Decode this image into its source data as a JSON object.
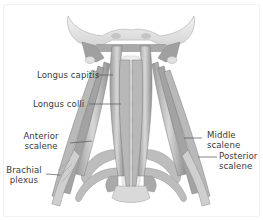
{
  "figure": {
    "style": "grayscale anatomical illustration",
    "colors": {
      "background": "#ffffff",
      "bone": "#e6e6e6",
      "bone_outline": "#b8b8b8",
      "muscle_dark": "#8c8c8c",
      "muscle_mid": "#a8a8a8",
      "muscle_light": "#cfcfcf",
      "label_text": "#3a3a3a",
      "leader_line": "#555555"
    }
  },
  "labels": {
    "longus_capitis": "Longus capitis",
    "longus_colli": "Longus colli",
    "anterior_scalene_1": "Anterior",
    "anterior_scalene_2": "scalene",
    "brachial_plexus_1": "Brachial",
    "brachial_plexus_2": "plexus",
    "middle_scalene_1": "Middle",
    "middle_scalene_2": "scalene",
    "posterior_scalene_1": "Posterior",
    "posterior_scalene_2": "scalene"
  }
}
